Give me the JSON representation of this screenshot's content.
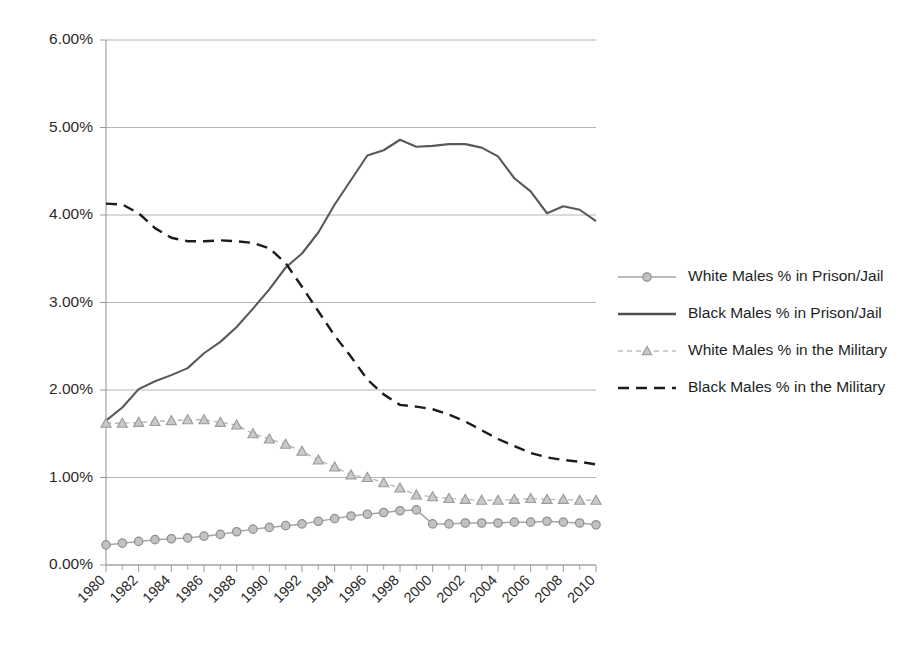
{
  "chart_data": {
    "type": "line",
    "title": "",
    "subtitle": "",
    "xlabel": "",
    "ylabel": "",
    "grid": "horizontal",
    "legend_position": "right",
    "ylim": [
      0,
      6
    ],
    "y_tick_labels": [
      "0.00%",
      "1.00%",
      "2.00%",
      "3.00%",
      "4.00%",
      "5.00%",
      "6.00%"
    ],
    "y_tick_values": [
      0,
      1,
      2,
      3,
      4,
      5,
      6
    ],
    "xlim": [
      1980,
      2010
    ],
    "x": [
      1980,
      1981,
      1982,
      1983,
      1984,
      1985,
      1986,
      1987,
      1988,
      1989,
      1990,
      1991,
      1992,
      1993,
      1994,
      1995,
      1996,
      1997,
      1998,
      1999,
      2000,
      2001,
      2002,
      2003,
      2004,
      2005,
      2006,
      2007,
      2008,
      2009,
      2010
    ],
    "x_tick_labels": [
      "1980",
      "1982",
      "1984",
      "1986",
      "1988",
      "1990",
      "1992",
      "1994",
      "1996",
      "1998",
      "2000",
      "2002",
      "2004",
      "2006",
      "2008",
      "2010"
    ],
    "x_tick_values": [
      1980,
      1982,
      1984,
      1986,
      1988,
      1990,
      1992,
      1994,
      1996,
      1998,
      2000,
      2002,
      2004,
      2006,
      2008,
      2010
    ],
    "series": [
      {
        "name": "White Males % in Prison/Jail",
        "key": "white_prison",
        "color": "#a6a6a6",
        "marker": "circle",
        "dash": "solid",
        "values": [
          0.23,
          0.25,
          0.27,
          0.29,
          0.3,
          0.31,
          0.33,
          0.35,
          0.38,
          0.41,
          0.43,
          0.45,
          0.47,
          0.5,
          0.53,
          0.56,
          0.58,
          0.6,
          0.62,
          0.63,
          0.47,
          0.47,
          0.48,
          0.48,
          0.48,
          0.49,
          0.49,
          0.5,
          0.49,
          0.48,
          0.46
        ]
      },
      {
        "name": "Black Males % in Prison/Jail",
        "key": "black_prison",
        "color": "#595959",
        "marker": "none",
        "dash": "solid",
        "values": [
          1.65,
          1.8,
          2.01,
          2.1,
          2.17,
          2.25,
          2.42,
          2.55,
          2.72,
          2.93,
          3.15,
          3.4,
          3.56,
          3.8,
          4.12,
          4.4,
          4.68,
          4.74,
          4.86,
          4.78,
          4.79,
          4.81,
          4.81,
          4.77,
          4.67,
          4.42,
          4.27,
          4.02,
          4.1,
          4.06,
          3.93
        ]
      },
      {
        "name": "White Males % in the Military",
        "key": "white_military",
        "color": "#b8b8b8",
        "marker": "triangle",
        "dash": "dashed",
        "values": [
          1.62,
          1.62,
          1.63,
          1.64,
          1.65,
          1.66,
          1.66,
          1.63,
          1.6,
          1.5,
          1.44,
          1.38,
          1.3,
          1.2,
          1.12,
          1.03,
          1.0,
          0.94,
          0.88,
          0.8,
          0.78,
          0.76,
          0.75,
          0.74,
          0.74,
          0.75,
          0.76,
          0.75,
          0.75,
          0.74,
          0.74
        ]
      },
      {
        "name": "Black Males % in the Military",
        "key": "black_military",
        "color": "#1c1c1c",
        "marker": "none",
        "dash": "dashed",
        "values": [
          4.13,
          4.12,
          4.02,
          3.85,
          3.74,
          3.7,
          3.7,
          3.71,
          3.7,
          3.68,
          3.62,
          3.45,
          3.18,
          2.9,
          2.62,
          2.38,
          2.12,
          1.95,
          1.83,
          1.81,
          1.78,
          1.72,
          1.64,
          1.54,
          1.44,
          1.36,
          1.28,
          1.23,
          1.2,
          1.18,
          1.15
        ]
      }
    ]
  },
  "legend": {
    "items": [
      {
        "label": "White Males % in Prison/Jail",
        "key": "white_prison"
      },
      {
        "label": "Black Males % in Prison/Jail",
        "key": "black_prison"
      },
      {
        "label": "White Males % in the Military",
        "key": "white_military"
      },
      {
        "label": "Black Males % in the Military",
        "key": "black_military"
      }
    ]
  }
}
